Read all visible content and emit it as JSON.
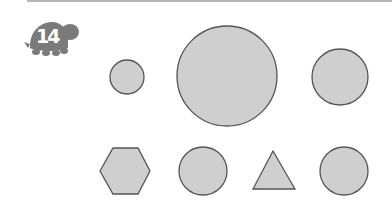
{
  "problem": {
    "number": "14",
    "badge_icon": "turtle-icon"
  },
  "colors": {
    "shape_fill": "#cfcfcf",
    "shape_stroke": "#555555",
    "badge": "#7a7a7a",
    "rule": "#b5b5b5"
  },
  "shapes": [
    {
      "type": "circle",
      "size": "small",
      "cx": 127,
      "cy": 77,
      "r": 17
    },
    {
      "type": "circle",
      "size": "large",
      "cx": 227,
      "cy": 76,
      "r": 50
    },
    {
      "type": "circle",
      "size": "medium",
      "cx": 340,
      "cy": 77,
      "r": 28
    },
    {
      "type": "hexagon",
      "points": "100,171 113,148 138,148 150,171 138,194 113,194"
    },
    {
      "type": "circle",
      "size": "medium-small",
      "cx": 203,
      "cy": 171,
      "r": 24
    },
    {
      "type": "triangle",
      "points": "273,151 253,189 295,189"
    },
    {
      "type": "circle",
      "size": "medium-small",
      "cx": 344,
      "cy": 171,
      "r": 24
    }
  ]
}
